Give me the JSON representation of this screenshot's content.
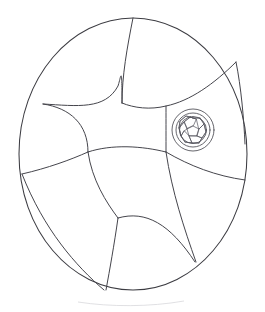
{
  "figure": {
    "style": "line-art",
    "background_color": "#ffffff",
    "stroke_color": "#3c3c42",
    "stroke_width": 1.05,
    "canvas": {
      "width": 265,
      "height": 312
    }
  },
  "outline": {
    "name": "oval-boundary",
    "shape": "ellipse",
    "center_x": 133,
    "center_y": 154,
    "radius_x": 114,
    "radius_y": 136,
    "left_edge": 19,
    "right_edge": 247,
    "top_edge": 18,
    "bottom_edge": 290,
    "path": "M 133 18 C 195 18 247 78 247 154 C 247 230 195 290 133 290 C 71 290 19 230 19 154 C 19 78 71 18 133 18 Z"
  },
  "partitions": [
    {
      "name": "arc-top-radial",
      "description": "radial arc from top of oval descending to central junction",
      "path": "M 133 18 C 127 48 122 76 122 103"
    },
    {
      "name": "arc-upper-left-lobe",
      "description": "large concave arc sweeping from left rim up and right to the central junction",
      "path": "M 43 104 C 78 106 105 110 118 86 C 121 77 122 62 122 103"
    },
    {
      "name": "arc-upper-left-inner",
      "description": "inner curve of upper-left lobe running from left rim to lower-centre junction",
      "path": "M 43 104 C 70 108 88 124 88 152"
    },
    {
      "name": "arc-upper-right-lobe",
      "description": "sweeping arc from top radial across the upper right toward the ring inset",
      "path": "M 122 103 C 134 108 150 110 166 106 C 190 101 214 84 236 62"
    },
    {
      "name": "arc-ring-connector",
      "description": "short arc descending from upper-right toward the circular inset junction",
      "path": "M 166 106 C 166 124 166 138 166 152"
    },
    {
      "name": "arc-centre-lower",
      "description": "concave arc forming the bottom of the central region between the two mid junctions",
      "path": "M 88 152 C 112 144 142 146 166 152"
    },
    {
      "name": "arc-left-mid-rim",
      "description": "near-horizontal arc from left rim to the left-centre junction",
      "path": "M 22 174 C 48 168 70 160 88 152"
    },
    {
      "name": "arc-lower-left-lobe",
      "description": "curve descending from left-centre junction to the bottom-centre junction",
      "path": "M 88 152 C 92 180 106 202 118 218"
    },
    {
      "name": "arc-lower-left-outer",
      "description": "arc from left rim sweeping down and right to the lower rim",
      "path": "M 22 174 C 44 230 76 266 104 290"
    },
    {
      "name": "arc-bottom-radial",
      "description": "short radial line from bottom-centre junction to the lower rim",
      "path": "M 118 218 C 114 246 110 268 106 290"
    },
    {
      "name": "arc-lower-right-lobe",
      "description": "arc from bottom-centre junction sweeping right and down to the lower-right rim",
      "path": "M 118 218 C 146 210 170 224 195 262"
    },
    {
      "name": "arc-right-lower-rim",
      "description": "arc from the right rim running left to the mid-right junction near the ring",
      "path": "M 245 180 C 216 176 190 166 166 152"
    },
    {
      "name": "arc-right-inner",
      "description": "long curve from the mid-right junction down to the lower-right rim",
      "path": "M 166 152 C 172 192 184 228 196 262"
    },
    {
      "name": "arc-upper-right-rim-tip",
      "description": "arc meeting the oval rim at the upper right",
      "path": "M 236 62 C 241 86 244 120 245 144"
    }
  ],
  "inset": {
    "name": "circular-detail-inset",
    "description": "small concentric circular structure filled with a mosaic of irregular cells",
    "center_x": 193,
    "center_y": 130,
    "rings": [
      {
        "name": "outer-ring",
        "radius": 21
      },
      {
        "name": "middle-ring",
        "radius": 17
      },
      {
        "name": "core-boundary",
        "radius": 13.5
      }
    ],
    "cells": [
      {
        "name": "cell-centre",
        "path": "M 193 126 L 199 129 L 197 136 L 189 136 L 187 129 Z"
      },
      {
        "name": "cell-n",
        "path": "M 193 126 L 187 129 L 184 122 L 190 117 L 196 119 Z"
      },
      {
        "name": "cell-ne",
        "path": "M 196 119 L 190 117 L 193 118 L 200 118 L 204 124 L 199 129 Z"
      },
      {
        "name": "cell-e",
        "path": "M 199 129 L 204 124 L 206 132 L 202 138 L 197 136 Z"
      },
      {
        "name": "cell-se",
        "path": "M 197 136 L 202 138 L 199 143 L 192 143 L 189 136 Z"
      },
      {
        "name": "cell-sw",
        "path": "M 189 136 L 192 143 L 185 142 L 181 136 L 184 131 Z"
      },
      {
        "name": "cell-w",
        "path": "M 187 129 L 184 131 L 181 136 L 179 128 L 184 122 Z"
      },
      {
        "name": "cell-nw",
        "path": "M 184 122 L 179 128 L 180 121 L 186 116 L 190 117 Z"
      },
      {
        "name": "cell-arc-n",
        "path": "M 190 117 L 193 118 L 200 118"
      },
      {
        "name": "cell-arc-ne",
        "path": "M 200 118 L 204 124 L 206 132"
      },
      {
        "name": "cell-arc-se",
        "path": "M 206 132 L 202 138 L 199 143"
      },
      {
        "name": "cell-arc-s",
        "path": "M 199 143 L 192 143 L 185 142"
      },
      {
        "name": "cell-arc-sw",
        "path": "M 185 142 L 181 136 L 179 128"
      },
      {
        "name": "cell-arc-nw",
        "path": "M 179 128 L 180 121 L 186 116 L 190 117"
      }
    ]
  },
  "regions": [
    {
      "name": "region-upper-left",
      "label": ""
    },
    {
      "name": "region-upper-right",
      "label": ""
    },
    {
      "name": "region-centre",
      "label": ""
    },
    {
      "name": "region-left",
      "label": ""
    },
    {
      "name": "region-lower-left",
      "label": ""
    },
    {
      "name": "region-lower-centre",
      "label": ""
    },
    {
      "name": "region-lower-right",
      "label": ""
    },
    {
      "name": "region-right",
      "label": ""
    }
  ],
  "junctions": [
    {
      "name": "junction-upper-centre",
      "x": 122,
      "y": 103
    },
    {
      "name": "junction-left-centre",
      "x": 88,
      "y": 152
    },
    {
      "name": "junction-right-centre",
      "x": 166,
      "y": 152
    },
    {
      "name": "junction-lower-centre",
      "x": 118,
      "y": 218
    },
    {
      "name": "junction-left-rim",
      "x": 43,
      "y": 104
    },
    {
      "name": "junction-left-rim-mid",
      "x": 22,
      "y": 174
    },
    {
      "name": "junction-top-rim",
      "x": 133,
      "y": 18
    },
    {
      "name": "junction-upper-right-rim",
      "x": 236,
      "y": 62
    },
    {
      "name": "junction-right-rim",
      "x": 245,
      "y": 180
    },
    {
      "name": "junction-bottom-rim",
      "x": 105,
      "y": 290
    },
    {
      "name": "junction-lower-right-rim",
      "x": 196,
      "y": 262
    }
  ],
  "artifact": {
    "name": "faint-baseline-smudge",
    "description": "very faint light-grey arc artifact below the oval near the bottom margin",
    "path": "M 78 302 C 110 307 150 307 184 301",
    "color": "#d8d8dc"
  }
}
